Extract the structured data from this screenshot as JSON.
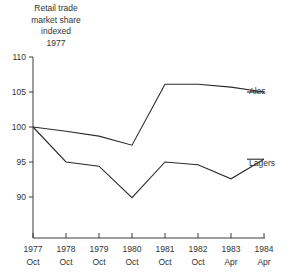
{
  "title": {
    "lines": [
      "Retail trade",
      "market share",
      "indexed",
      "1977"
    ]
  },
  "axes": {
    "y_ticks": [
      "110",
      "105",
      "100",
      "95",
      "90"
    ],
    "y_values": [
      110,
      105,
      100,
      95,
      90
    ],
    "x_ticks_year": [
      "1977",
      "1978",
      "1979",
      "1980",
      "1981",
      "1982",
      "1983",
      "1984"
    ],
    "x_ticks_month": [
      "Oct",
      "Oct",
      "Oct",
      "Oct",
      "Oct",
      "Oct",
      "Apr",
      "Apr"
    ]
  },
  "series_labels": {
    "ales": "Ales",
    "lagers": "Lagers"
  },
  "colors": {
    "line": "#2b2b2b",
    "axis": "#3a3a3a",
    "text": "#333333",
    "background": "#ffffff"
  },
  "chart_data": {
    "type": "line",
    "title": "Retail trade market share indexed 1977",
    "xlabel": "",
    "ylabel": "",
    "ylim": [
      88,
      111
    ],
    "grid": false,
    "legend_position": "right-inline",
    "categories": [
      "1977 Oct",
      "1978 Oct",
      "1979 Oct",
      "1980 Oct",
      "1981 Oct",
      "1982 Oct",
      "1983 Apr",
      "1984 Apr"
    ],
    "series": [
      {
        "name": "Ales",
        "values": [
          100,
          99.4,
          98.7,
          97.4,
          106.1,
          106.1,
          105.7,
          105.0
        ]
      },
      {
        "name": "Lagers",
        "values": [
          100,
          95.0,
          94.4,
          89.9,
          95.0,
          94.6,
          92.6,
          95.4
        ]
      }
    ]
  }
}
